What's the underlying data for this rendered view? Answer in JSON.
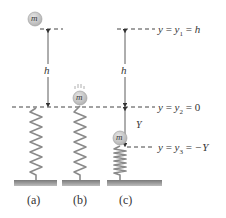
{
  "diagram": {
    "type": "spring-mass energy diagram",
    "panels": [
      {
        "id": "a",
        "label": "(a)",
        "mass_label": "m",
        "mass_position": "y1 (height h above spring)"
      },
      {
        "id": "b",
        "label": "(b)",
        "mass_label": "m",
        "mass_position": "y2 (touching top of spring)"
      },
      {
        "id": "c",
        "label": "(c)",
        "mass_label": "m",
        "mass_position": "y3 (spring compressed by Y)"
      }
    ],
    "levels": [
      {
        "id": "y1",
        "label": "y = y₁ = h",
        "var": "y",
        "sub": "1",
        "rhs": "h"
      },
      {
        "id": "y2",
        "label": "y = y₂ = 0",
        "var": "y",
        "sub": "2",
        "rhs": "0"
      },
      {
        "id": "y3",
        "label": "y = y₃ = −Y",
        "var": "y",
        "sub": "3",
        "rhs": "−Y"
      }
    ],
    "dimensions": [
      {
        "id": "h-a",
        "label": "h",
        "from": "y1",
        "to": "y2"
      },
      {
        "id": "h-c",
        "label": "h",
        "from": "y1",
        "to": "y2"
      },
      {
        "id": "Y-c",
        "label": "Y",
        "from": "y2",
        "to": "y3"
      }
    ],
    "colors": {
      "ball": "#c8c8c8",
      "ball_edge": "#9a9a9a",
      "spring": "#8a8a8a",
      "ground": "#8c8c8c",
      "dash": "#444444",
      "text": "#333333"
    }
  },
  "text": {
    "mass": "m",
    "h": "h",
    "Y": "Y",
    "eq_y": "y",
    "eq_eq": " = ",
    "y1_sub": "1",
    "y1_rhs": "h",
    "y2_sub": "2",
    "y2_rhs": "0",
    "y3_sub": "3",
    "y3_rhs": "−Y",
    "panel_a": "(a)",
    "panel_b": "(b)",
    "panel_c": "(c)"
  }
}
